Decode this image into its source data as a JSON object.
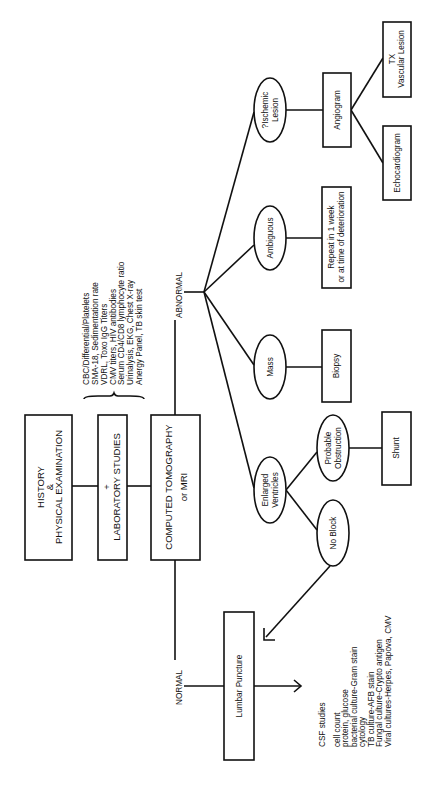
{
  "diagram": {
    "orientation": "rotated-90-ccw",
    "start": {
      "history": [
        "HISTORY",
        "&",
        "PHYSICAL EXAMINATION"
      ],
      "lab": [
        "+",
        "LABORATORY STUDIES"
      ],
      "imaging": [
        "COMPUTED TOMOGRAPHY",
        "or MRI"
      ]
    },
    "lab_list": [
      "CBC/Differential/Platelets",
      "SMA-18, Sedimentation rate",
      "VDRL, Toxo IgG Titers",
      "CMV titers, HIV antibodies",
      "Serum CD4/CD8 lymphocyte ratio",
      "Urinalysis, EKG, Chest X-ray",
      "Anergy Panel, TB skin test"
    ],
    "branches": {
      "abnormal": "ABNORMAL",
      "normal": "NORMAL"
    },
    "abnormal_findings": {
      "ischemic": [
        "?Ischemic",
        "Lesion"
      ],
      "ambiguous": "Ambiguous",
      "mass": "Mass",
      "enlarged": [
        "Enlarged",
        "Ventricles"
      ],
      "probable_obstruction": [
        "Probable",
        "Obstruction"
      ],
      "no_block": "No Block"
    },
    "actions": {
      "angiogram": "Angiogram",
      "tx_vascular": [
        "TX",
        "Vascular Lesion"
      ],
      "echocardiogram": "Echocardiogram",
      "repeat": [
        "Repeat in 1 week",
        "or at time of deterioration"
      ],
      "biopsy": "Biopsy",
      "shunt": "Shunt",
      "lumbar_puncture": "Lumbar Puncture"
    },
    "csf": {
      "title": "CSF studies",
      "items": [
        "cell count",
        "protein, glucose",
        "bacterial culture-Gram stain",
        "cytology",
        "TB culture-AFB stain",
        "Fungal culture-Crypto antigen",
        "Viral cultures-Herpes, Papova, CMV"
      ]
    }
  }
}
